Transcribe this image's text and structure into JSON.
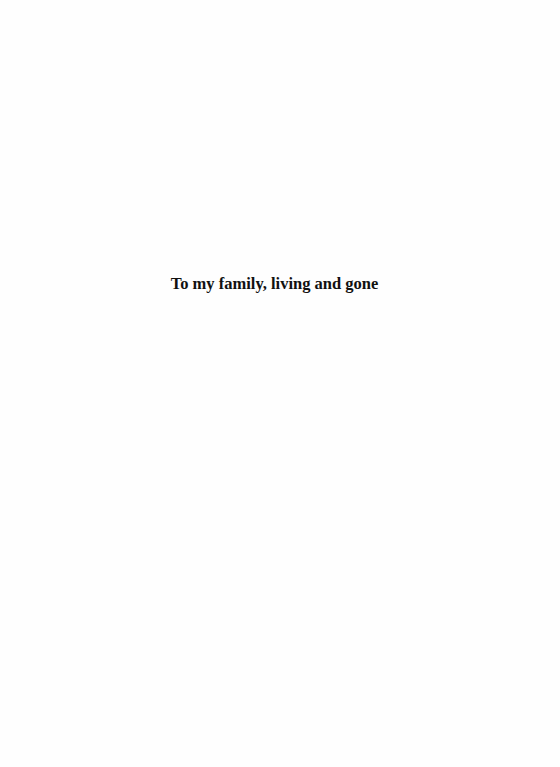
{
  "page": {
    "dedication": "To my family, living and gone"
  }
}
